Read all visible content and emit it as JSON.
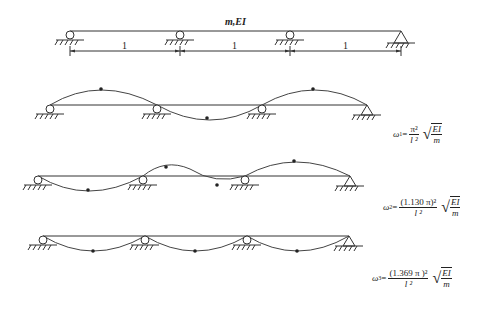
{
  "beam": {
    "label": "m,EI",
    "spans": [
      "1",
      "1",
      "1"
    ]
  },
  "modes": [
    {
      "omega": "ω",
      "sub": "1",
      "numerator": "π²",
      "denominator": "l ²",
      "root_top": "EI",
      "root_bottom": "m"
    },
    {
      "omega": "ω",
      "sub": "2",
      "numerator": "(1.130 π)²",
      "denominator": "l ²",
      "root_top": "EI",
      "root_bottom": "m"
    },
    {
      "omega": "ω",
      "sub": "3",
      "numerator": "(1.369 π )²",
      "denominator": "l ²",
      "root_top": "EI",
      "root_bottom": "m"
    }
  ]
}
